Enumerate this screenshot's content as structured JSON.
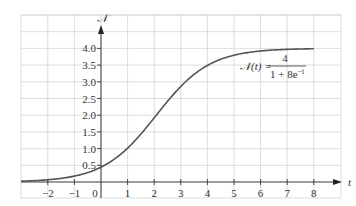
{
  "chart_data": {
    "type": "line",
    "title": "",
    "xlabel": "t",
    "ylabel": "𝒩",
    "xlim": [
      -3,
      9
    ],
    "ylim": [
      0,
      5
    ],
    "grid": true,
    "x_ticks": [
      -2,
      -1,
      0,
      1,
      2,
      3,
      4,
      5,
      6,
      7,
      8
    ],
    "x_tick_labels": [
      "−2",
      "−1",
      "0",
      "1",
      "2",
      "3",
      "4",
      "5",
      "6",
      "7",
      "8"
    ],
    "y_ticks": [
      0.5,
      1.0,
      1.5,
      2.0,
      2.5,
      3.0,
      3.5,
      4.0
    ],
    "y_tick_labels": [
      "0.5",
      "1.0",
      "1.5",
      "2.0",
      "2.5",
      "3.0",
      "3.5",
      "4.0"
    ],
    "series": [
      {
        "name": "𝒩(t) = 4 / (1 + 8e^(−t))",
        "function": "4/(1+8*exp(-t))",
        "x_range": [
          -3,
          8
        ],
        "x": [
          -3,
          -2,
          -1,
          0,
          1,
          2,
          3,
          4,
          5,
          6,
          7,
          8
        ],
        "y": [
          0.02,
          0.06,
          0.16,
          0.44,
          1.01,
          1.92,
          2.86,
          3.48,
          3.8,
          3.93,
          3.97,
          3.99
        ]
      }
    ],
    "annotation": {
      "lhs": "𝒩(t) =",
      "numerator": "4",
      "denominator_base": "1 + 8e",
      "denominator_exp": "−t"
    }
  }
}
